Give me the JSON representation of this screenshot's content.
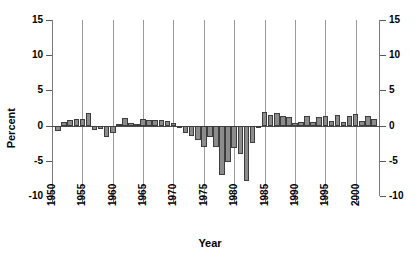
{
  "chart_data": {
    "type": "bar",
    "title": "",
    "xlabel": "Year",
    "ylabel": "Percent",
    "ylim": [
      -10,
      15
    ],
    "xlim": [
      1950,
      2004
    ],
    "ytick_values": [
      15,
      10,
      5,
      0,
      -5,
      -10
    ],
    "ytick_labels": [
      "15",
      "10",
      "5",
      "0",
      "-5",
      "-10"
    ],
    "ytick_labels_right": [
      "15",
      "10",
      "5",
      "0",
      "-5",
      "-10"
    ],
    "xtick_values": [
      1950,
      1955,
      1960,
      1965,
      1970,
      1975,
      1980,
      1985,
      1990,
      1995,
      2000
    ],
    "xtick_labels": [
      "1950",
      "1955",
      "1960",
      "1965",
      "1970",
      "1975",
      "1980",
      "1985",
      "1990",
      "1995",
      "2000"
    ],
    "gridlines": {
      "vertical": [
        1955,
        1960,
        1965,
        1970,
        1975,
        1980,
        1985,
        1990,
        1995,
        2000
      ],
      "horizontal": []
    },
    "legend": null,
    "bar_color": "#8c8c8c",
    "bar_edge_color": "#3d3d3d",
    "categories": [
      1951,
      1952,
      1953,
      1954,
      1955,
      1956,
      1957,
      1958,
      1959,
      1960,
      1961,
      1962,
      1963,
      1964,
      1965,
      1966,
      1967,
      1968,
      1969,
      1970,
      1971,
      1972,
      1973,
      1974,
      1975,
      1976,
      1977,
      1978,
      1979,
      1980,
      1981,
      1982,
      1983,
      1984,
      1985,
      1986,
      1987,
      1988,
      1989,
      1990,
      1991,
      1992,
      1993,
      1994,
      1995,
      1996,
      1997,
      1998,
      1999,
      2000,
      2001,
      2002,
      2003
    ],
    "values": [
      -0.8,
      0.5,
      0.8,
      0.9,
      1.0,
      1.8,
      -0.6,
      -0.5,
      -1.6,
      -1.1,
      0.2,
      1.1,
      0.3,
      0.2,
      0.9,
      0.8,
      0.8,
      0.8,
      0.7,
      0.3,
      -0.3,
      -1.1,
      -1.5,
      -2.0,
      -3.0,
      -1.6,
      -3.1,
      -7.0,
      -5.2,
      -3.2,
      -4.0,
      -7.8,
      -2.5,
      -0.4,
      1.9,
      1.5,
      1.8,
      1.4,
      1.2,
      0.4,
      0.5,
      1.3,
      0.5,
      1.2,
      1.4,
      0.6,
      1.5,
      0.5,
      1.4,
      1.6,
      0.6,
      1.4,
      0.9
    ]
  }
}
